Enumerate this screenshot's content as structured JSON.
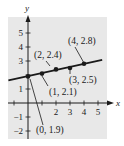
{
  "chart_data": {
    "type": "scatter",
    "title": "",
    "xlabel": "x",
    "ylabel": "y",
    "xlim": [
      -1.5,
      5.5
    ],
    "ylim": [
      -2.5,
      6
    ],
    "x_ticks": [
      "2",
      "3",
      "4",
      "5"
    ],
    "y_ticks": [
      "5",
      "4",
      "3",
      "1",
      "-1",
      "-2"
    ],
    "grid": false,
    "points": [
      {
        "x": 0,
        "y": 1.9,
        "label": "(0, 1.9)"
      },
      {
        "x": 1,
        "y": 2.1,
        "label": "(1, 2.1)"
      },
      {
        "x": 2,
        "y": 2.4,
        "label": "(2, 2.4)"
      },
      {
        "x": 3,
        "y": 2.5,
        "label": "(3, 2.5)"
      },
      {
        "x": 4,
        "y": 2.8,
        "label": "(4, 2.8)"
      }
    ],
    "fit_line": {
      "slope": 0.22,
      "intercept": 1.92,
      "x_range": [
        -1.4,
        5.3
      ]
    },
    "colors": {
      "background": "#e8e8e8",
      "ink": "#1a1a1a"
    }
  }
}
